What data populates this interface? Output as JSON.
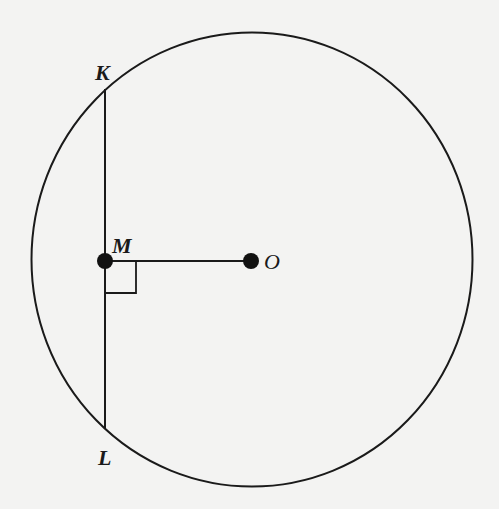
{
  "diagram": {
    "type": "circle-geometry",
    "circle": {
      "center": "O",
      "cx": 252,
      "cy": 259,
      "r": 222
    },
    "points": [
      {
        "id": "K",
        "label": "K",
        "x": 105,
        "y": 89,
        "on": "circle"
      },
      {
        "id": "L",
        "label": "L",
        "x": 105,
        "y": 429,
        "on": "circle"
      },
      {
        "id": "M",
        "label": "M",
        "x": 105,
        "y": 261,
        "marked": true
      },
      {
        "id": "O",
        "label": "O",
        "x": 251,
        "y": 261,
        "marked": true
      }
    ],
    "segments": [
      {
        "from": "K",
        "to": "L",
        "name": "chord-KL"
      },
      {
        "from": "M",
        "to": "O",
        "name": "segment-MO"
      }
    ],
    "right_angle": {
      "at": "M",
      "between": [
        "MO",
        "ML"
      ],
      "size": 31
    },
    "colors": {
      "stroke": "#1a1a1a",
      "background": "#f3f3f2"
    }
  },
  "labels": {
    "K": "K",
    "L": "L",
    "M": "M",
    "O": "O"
  }
}
